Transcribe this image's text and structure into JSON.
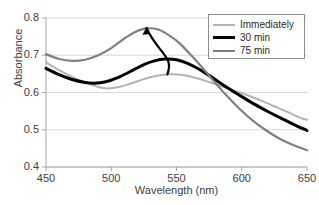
{
  "chart_data": {
    "type": "line",
    "title": "",
    "xlabel": "Wavelength (nm)",
    "ylabel": "Absorbance",
    "xlim": [
      450,
      650
    ],
    "ylim": [
      0.4,
      0.8
    ],
    "xticks": [
      "450",
      "500",
      "550",
      "600",
      "650"
    ],
    "yticks": [
      "0.8",
      "0.7",
      "0.6",
      "0.5",
      "0.4"
    ],
    "grid": true,
    "legend_position": "top-right",
    "series": [
      {
        "name": "Immediately",
        "color": "#b3b3b3",
        "width": 2.0,
        "x": [
          450,
          460,
          470,
          480,
          490,
          497,
          505,
          515,
          525,
          535,
          546,
          555,
          565,
          575,
          585,
          595,
          605,
          615,
          625,
          635,
          645,
          650
        ],
        "values": [
          0.681,
          0.66,
          0.642,
          0.627,
          0.615,
          0.611,
          0.614,
          0.624,
          0.636,
          0.645,
          0.649,
          0.647,
          0.639,
          0.628,
          0.616,
          0.604,
          0.592,
          0.578,
          0.563,
          0.548,
          0.532,
          0.527
        ]
      },
      {
        "name": "30 min",
        "color": "#000000",
        "width": 3.0,
        "x": [
          450,
          460,
          470,
          480,
          487,
          495,
          505,
          515,
          525,
          533,
          541,
          550,
          558,
          566,
          574,
          582,
          590,
          600,
          610,
          620,
          630,
          640,
          650
        ],
        "values": [
          0.665,
          0.648,
          0.635,
          0.627,
          0.625,
          0.628,
          0.64,
          0.657,
          0.675,
          0.685,
          0.69,
          0.688,
          0.679,
          0.665,
          0.648,
          0.629,
          0.611,
          0.589,
          0.568,
          0.549,
          0.531,
          0.514,
          0.498
        ]
      },
      {
        "name": "75 min",
        "color": "#808080",
        "width": 2.2,
        "x": [
          450,
          460,
          470,
          480,
          490,
          500,
          510,
          518,
          527,
          536,
          545,
          553,
          562,
          570,
          578,
          588,
          598,
          608,
          618,
          628,
          638,
          650
        ],
        "values": [
          0.703,
          0.69,
          0.685,
          0.688,
          0.7,
          0.719,
          0.745,
          0.762,
          0.772,
          0.769,
          0.752,
          0.73,
          0.697,
          0.666,
          0.633,
          0.593,
          0.557,
          0.526,
          0.5,
          0.478,
          0.461,
          0.445
        ]
      }
    ],
    "annotations": [
      {
        "name": "trend-arrow",
        "type": "arrow",
        "from": [
          543,
          0.649
        ],
        "to": [
          527,
          0.773
        ],
        "color": "#000000"
      }
    ]
  },
  "axes": {
    "y_title": "Absorbance",
    "x_title": "Wavelength (nm)"
  },
  "legend": {
    "items": [
      {
        "label": "Immediately",
        "color": "#b3b3b3",
        "width": 2.0
      },
      {
        "label": "30 min",
        "color": "#000000",
        "width": 3.0
      },
      {
        "label": "75 min",
        "color": "#808080",
        "width": 2.2
      }
    ]
  }
}
